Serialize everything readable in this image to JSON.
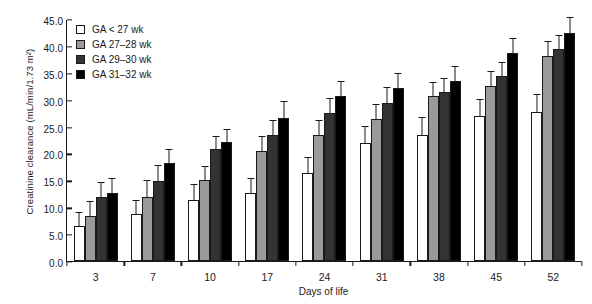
{
  "chart_data": {
    "type": "bar",
    "title": "",
    "xlabel": "Days of life",
    "ylabel": "Creatinine clearance (mL/min/1.73 m²)",
    "categories": [
      "3",
      "7",
      "10",
      "17",
      "24",
      "31",
      "38",
      "45",
      "52"
    ],
    "ylim": [
      0.0,
      45.0
    ],
    "yticks": [
      "0.0",
      "5.0",
      "10.0",
      "15.0",
      "20.0",
      "25.0",
      "30.0",
      "35.0",
      "40.0",
      "45.0"
    ],
    "ytick_values": [
      0,
      5,
      10,
      15,
      20,
      25,
      30,
      35,
      40,
      45
    ],
    "grid": false,
    "legend_position": "top-left",
    "errorbars": "upper only (SD)",
    "series": [
      {
        "name": "GA < 27 wk",
        "color": "#ffffff",
        "values": [
          6.6,
          8.8,
          11.3,
          12.6,
          16.4,
          21.9,
          23.4,
          26.9,
          27.8
        ],
        "errors": [
          2.3,
          2.4,
          2.8,
          2.6,
          2.7,
          3.0,
          3.2,
          3.1,
          3.1
        ]
      },
      {
        "name": "GA 27–28 wk",
        "color": "#9a9a9a",
        "values": [
          8.4,
          11.9,
          15.0,
          20.4,
          23.5,
          26.4,
          30.6,
          32.6,
          38.2
        ],
        "errors": [
          2.5,
          2.9,
          2.5,
          2.6,
          2.6,
          2.6,
          2.5,
          2.6,
          2.5
        ]
      },
      {
        "name": "GA 29–30 wk",
        "color": "#333333",
        "values": [
          11.9,
          14.9,
          20.8,
          23.5,
          27.6,
          29.3,
          31.4,
          34.4,
          39.5
        ],
        "errors": [
          2.7,
          2.7,
          2.3,
          2.6,
          2.5,
          2.9,
          2.4,
          2.5,
          2.4
        ]
      },
      {
        "name": "GA 31–32 wk",
        "color": "#000000",
        "values": [
          12.6,
          18.2,
          22.1,
          26.6,
          30.6,
          32.2,
          33.4,
          38.7,
          42.4
        ],
        "errors": [
          2.6,
          2.5,
          2.3,
          2.9,
          2.6,
          2.6,
          2.6,
          2.6,
          2.7
        ]
      }
    ]
  }
}
